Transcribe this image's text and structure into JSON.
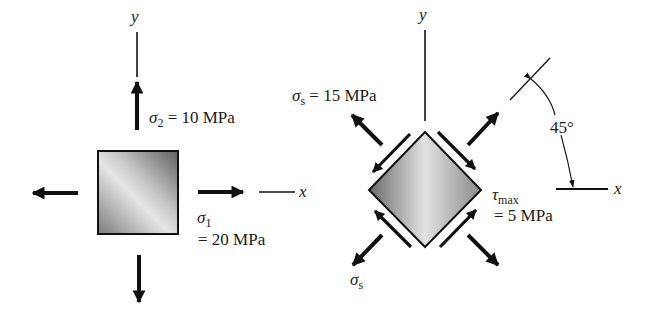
{
  "figure": {
    "left_element": {
      "axis_y_label": "y",
      "axis_x_label": "x",
      "sigma2": {
        "symbol": "σ",
        "subscript": "2",
        "value_text": " = 10 MPa"
      },
      "sigma1": {
        "symbol": "σ",
        "subscript": "1",
        "value_text": "= 20 MPa"
      }
    },
    "right_element": {
      "axis_y_label": "y",
      "axis_x_label": "x",
      "sigma_s_top": {
        "symbol": "σ",
        "subscript": "s",
        "value_text": " = 15 MPa"
      },
      "sigma_s_bottom": {
        "symbol": "σ",
        "subscript": "s"
      },
      "tau_max": {
        "symbol": "τ",
        "subscript": "max",
        "value_text": "= 5 MPa"
      },
      "angle_label": "45°"
    },
    "colors": {
      "stroke": "#111111",
      "element_light": "#e8e8e8",
      "element_dark": "#6e6e6e"
    }
  }
}
